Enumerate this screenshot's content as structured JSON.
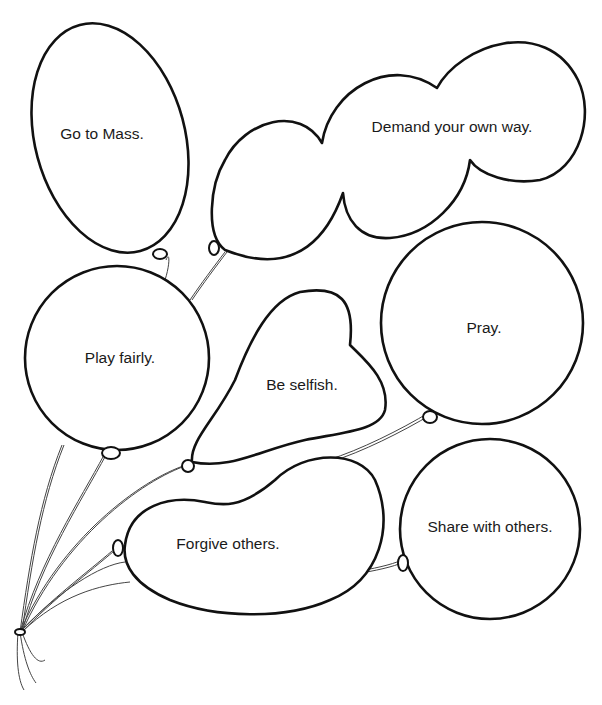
{
  "worksheet": {
    "balloons": [
      {
        "id": "go-to-mass",
        "label": "Go to Mass.",
        "x": 102,
        "y": 134
      },
      {
        "id": "demand-your-own-way",
        "label": "Demand your own way.",
        "x": 452,
        "y": 127
      },
      {
        "id": "play-fairly",
        "label": "Play fairly.",
        "x": 120,
        "y": 358
      },
      {
        "id": "be-selfish",
        "label": "Be selfish.",
        "x": 302,
        "y": 385
      },
      {
        "id": "pray",
        "label": "Pray.",
        "x": 484,
        "y": 328
      },
      {
        "id": "forgive-others",
        "label": "Forgive others.",
        "x": 228,
        "y": 544
      },
      {
        "id": "share-with-others",
        "label": "Share with others.",
        "x": 490,
        "y": 527
      }
    ]
  }
}
